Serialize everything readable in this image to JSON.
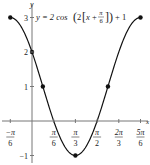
{
  "chart_data": {
    "type": "line",
    "title_parts": {
      "lhs": "y = 2 cos",
      "inner_coef": "2",
      "x_var": "x",
      "plus": "+",
      "frac_num": "π",
      "frac_den": "6",
      "tail": "+ 1"
    },
    "xlabel": "x",
    "ylabel": "y",
    "xlim": [
      -0.5236,
      2.618
    ],
    "ylim": [
      -1,
      3
    ],
    "grid": false,
    "x_ticks": [
      {
        "num": "−π",
        "den": "6",
        "value": -0.5236
      },
      {
        "num": "π",
        "den": "6",
        "value": 0.5236
      },
      {
        "num": "π",
        "den": "3",
        "value": 1.0472
      },
      {
        "num": "π",
        "den": "2",
        "value": 1.5708
      },
      {
        "num": "2π",
        "den": "3",
        "value": 2.0944
      },
      {
        "num": "5π",
        "den": "6",
        "value": 2.618
      }
    ],
    "y_ticks": [
      {
        "label": "3",
        "value": 3
      },
      {
        "label": "2",
        "value": 2
      },
      {
        "label": "1",
        "value": 1
      },
      {
        "label": "−1",
        "value": -1
      }
    ],
    "function": "2*cos(2*(x + pi/6)) + 1",
    "marked_points": [
      {
        "x": "-π/6",
        "xv": -0.5236,
        "y": 3
      },
      {
        "x": "0",
        "xv": 0,
        "y": 2
      },
      {
        "x": "π/12",
        "xv": 0.2618,
        "y": 1
      },
      {
        "x": "π/3",
        "xv": 1.0472,
        "y": -1
      },
      {
        "x": "7π/12",
        "xv": 1.8326,
        "y": 1
      },
      {
        "x": "5π/6",
        "xv": 2.618,
        "y": 3
      }
    ],
    "line_color": "#111111",
    "axis_color": "#777777"
  }
}
